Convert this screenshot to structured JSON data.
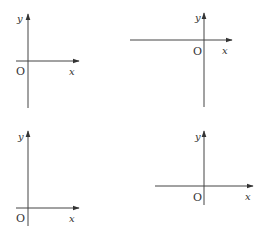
{
  "figure": {
    "axis_color": "#333333",
    "panels": [
      {
        "id": "top-left",
        "labels": {
          "y": "y",
          "origin": "O",
          "x": "x"
        },
        "origin_position": "lower-left quadrant offset; x-axis extends mostly right, y-axis extends up and down"
      },
      {
        "id": "top-right",
        "labels": {
          "y": "y",
          "origin": "O",
          "x": "x"
        },
        "origin_position": "upper-right; x-axis extends far left, y-axis extends far down"
      },
      {
        "id": "bottom-left",
        "labels": {
          "y": "y",
          "origin": "O",
          "x": "x"
        },
        "origin_position": "bottom-left; axes extend right and up"
      },
      {
        "id": "bottom-right",
        "labels": {
          "y": "y",
          "origin": "O",
          "x": "x"
        },
        "origin_position": "lower-middle; x-axis extends left and right, y-axis extends up"
      }
    ]
  }
}
